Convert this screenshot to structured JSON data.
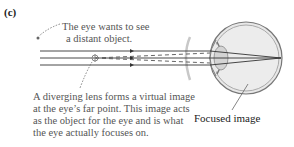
{
  "figure": {
    "panel_label": "(c)",
    "annotations": {
      "eye_wants": [
        "The eye wants to see",
        "a distant object."
      ],
      "diverging_lens": [
        "A diverging lens forms a virtual image",
        "at the eye’s far point. This image acts",
        "as the object for the eye and is what",
        "the eye actually focuses on."
      ],
      "focused_image": "Focused image"
    },
    "colors": {
      "ray": "#333333",
      "dashed_ray": "#555555",
      "eye_fill": "#e6e6e6",
      "eye_outline": "#777777",
      "lens": "#bbbbbb"
    }
  }
}
